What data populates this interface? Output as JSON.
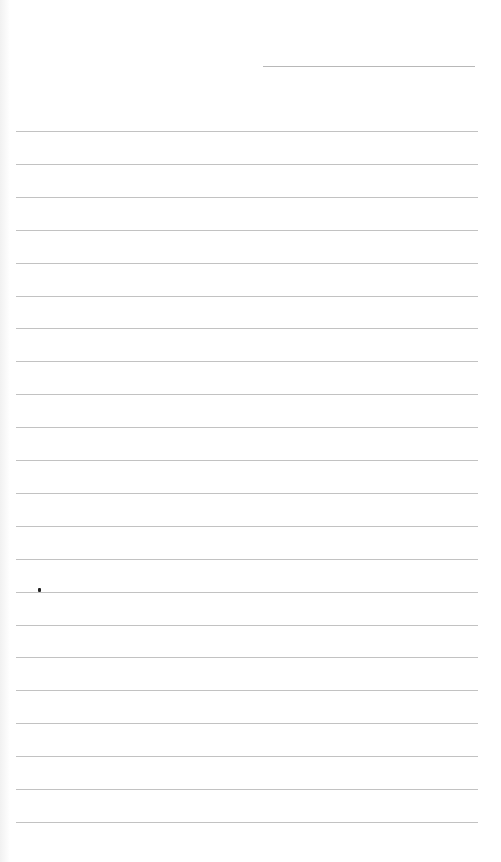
{
  "page": {
    "type": "blank lined paper",
    "date_line": {
      "present": true
    },
    "ruled_lines": {
      "count": 22,
      "first_y": 131,
      "spacing": 32.9,
      "color": "#c2c2c2"
    },
    "background": "#ffffff"
  }
}
